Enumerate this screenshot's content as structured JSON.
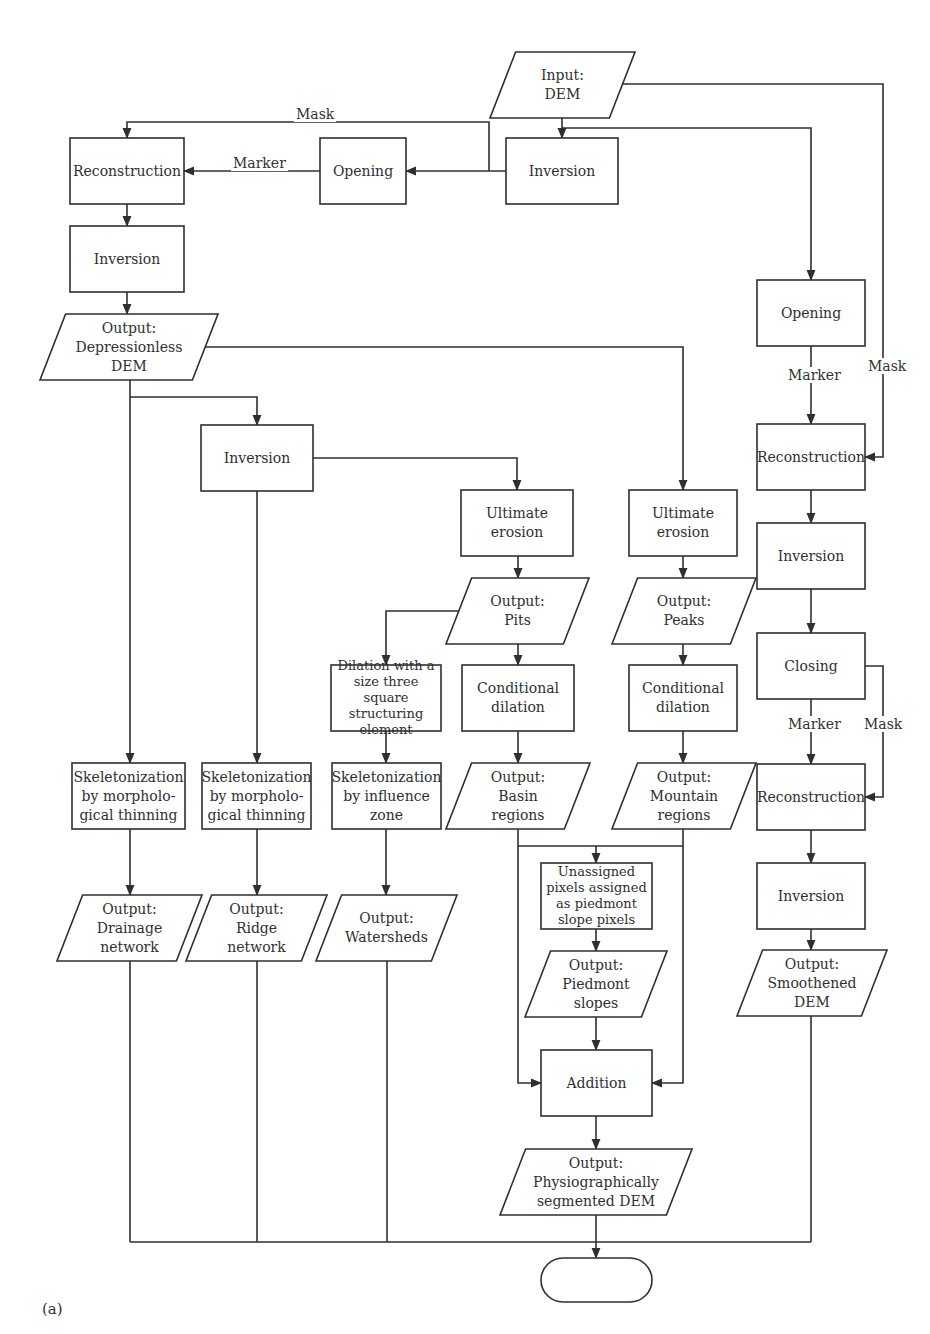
{
  "figure_label": "(a)",
  "nodes": [
    {
      "id": "input_dem",
      "shape": "parallelogram",
      "x": 490,
      "y": 52,
      "w": 145,
      "h": 66,
      "label": "Input:\nDEM"
    },
    {
      "id": "inversion_top",
      "shape": "rect",
      "x": 506,
      "y": 138,
      "w": 112,
      "h": 66,
      "label": "Inversion"
    },
    {
      "id": "opening_top",
      "shape": "rect",
      "x": 320,
      "y": 138,
      "w": 86,
      "h": 66,
      "label": "Opening"
    },
    {
      "id": "reconstruction_left",
      "shape": "rect",
      "x": 70,
      "y": 138,
      "w": 114,
      "h": 66,
      "label": "Reconstruction"
    },
    {
      "id": "inversion_left",
      "shape": "rect",
      "x": 70,
      "y": 226,
      "w": 114,
      "h": 66,
      "label": "Inversion"
    },
    {
      "id": "output_depressionless",
      "shape": "parallelogram",
      "x": 40,
      "y": 314,
      "w": 178,
      "h": 66,
      "label": "Output:\nDepressionless\nDEM"
    },
    {
      "id": "inversion_mid",
      "shape": "rect",
      "x": 201,
      "y": 425,
      "w": 112,
      "h": 66,
      "label": "Inversion"
    },
    {
      "id": "ultimate_erosion_pits",
      "shape": "rect",
      "x": 461,
      "y": 490,
      "w": 112,
      "h": 66,
      "label": "Ultimate\nerosion"
    },
    {
      "id": "ultimate_erosion_peaks",
      "shape": "rect",
      "x": 629,
      "y": 490,
      "w": 108,
      "h": 66,
      "label": "Ultimate\nerosion"
    },
    {
      "id": "opening_right",
      "shape": "rect",
      "x": 757,
      "y": 280,
      "w": 108,
      "h": 66,
      "label": "Opening"
    },
    {
      "id": "reconstruction_right1",
      "shape": "rect",
      "x": 757,
      "y": 424,
      "w": 108,
      "h": 66,
      "label": "Reconstruction"
    },
    {
      "id": "inversion_right1",
      "shape": "rect",
      "x": 757,
      "y": 523,
      "w": 108,
      "h": 66,
      "label": "Inversion"
    },
    {
      "id": "closing",
      "shape": "rect",
      "x": 757,
      "y": 633,
      "w": 108,
      "h": 66,
      "label": "Closing"
    },
    {
      "id": "reconstruction_right2",
      "shape": "rect",
      "x": 757,
      "y": 764,
      "w": 108,
      "h": 66,
      "label": "Reconstruction"
    },
    {
      "id": "inversion_right2",
      "shape": "rect",
      "x": 757,
      "y": 863,
      "w": 108,
      "h": 66,
      "label": "Inversion"
    },
    {
      "id": "output_smoothened",
      "shape": "parallelogram",
      "x": 737,
      "y": 950,
      "w": 150,
      "h": 66,
      "label": "Output:\nSmoothened\nDEM"
    },
    {
      "id": "output_pits",
      "shape": "parallelogram",
      "x": 446,
      "y": 578,
      "w": 143,
      "h": 66,
      "label": "Output:\nPits"
    },
    {
      "id": "output_peaks",
      "shape": "parallelogram",
      "x": 612,
      "y": 578,
      "w": 144,
      "h": 66,
      "label": "Output:\nPeaks"
    },
    {
      "id": "dilation_square",
      "shape": "rect",
      "x": 331,
      "y": 665,
      "w": 110,
      "h": 66,
      "label": "Dilation with a\nsize three square\nstructuring\nelement",
      "small": true
    },
    {
      "id": "conditional_dilation_basin",
      "shape": "rect",
      "x": 462,
      "y": 665,
      "w": 112,
      "h": 66,
      "label": "Conditional\ndilation"
    },
    {
      "id": "conditional_dilation_mountain",
      "shape": "rect",
      "x": 629,
      "y": 665,
      "w": 108,
      "h": 66,
      "label": "Conditional\ndilation"
    },
    {
      "id": "skeleton_drainage",
      "shape": "rect",
      "x": 72,
      "y": 763,
      "w": 113,
      "h": 66,
      "label": "Skeletonization\nby morpholo-\ngical thinning"
    },
    {
      "id": "skeleton_ridge",
      "shape": "rect",
      "x": 202,
      "y": 763,
      "w": 109,
      "h": 66,
      "label": "Skeletonization\nby morpholo-\ngical thinning"
    },
    {
      "id": "skeleton_influence",
      "shape": "rect",
      "x": 332,
      "y": 763,
      "w": 109,
      "h": 66,
      "label": "Skeletonization\nby influence\nzone"
    },
    {
      "id": "output_basin",
      "shape": "parallelogram",
      "x": 446,
      "y": 763,
      "w": 144,
      "h": 66,
      "label": "Output:\nBasin\nregions"
    },
    {
      "id": "output_mountain",
      "shape": "parallelogram",
      "x": 612,
      "y": 763,
      "w": 144,
      "h": 66,
      "label": "Output:\nMountain\nregions"
    },
    {
      "id": "output_drainage",
      "shape": "parallelogram",
      "x": 57,
      "y": 895,
      "w": 145,
      "h": 66,
      "label": "Output:\nDrainage\nnetwork"
    },
    {
      "id": "output_ridge",
      "shape": "parallelogram",
      "x": 186,
      "y": 895,
      "w": 141,
      "h": 66,
      "label": "Output:\nRidge\nnetwork"
    },
    {
      "id": "output_watersheds",
      "shape": "parallelogram",
      "x": 316,
      "y": 895,
      "w": 141,
      "h": 66,
      "label": "Output:\nWatersheds"
    },
    {
      "id": "unassigned_pixels",
      "shape": "rect",
      "x": 541,
      "y": 863,
      "w": 111,
      "h": 66,
      "label": "Unassigned\npixels assigned\nas piedmont\nslope pixels",
      "small": true
    },
    {
      "id": "output_piedmont",
      "shape": "parallelogram",
      "x": 525,
      "y": 951,
      "w": 142,
      "h": 66,
      "label": "Output:\nPiedmont\nslopes"
    },
    {
      "id": "addition",
      "shape": "rect",
      "x": 541,
      "y": 1050,
      "w": 111,
      "h": 66,
      "label": "Addition"
    },
    {
      "id": "output_segmented",
      "shape": "parallelogram",
      "x": 500,
      "y": 1149,
      "w": 192,
      "h": 66,
      "label": "Output:\nPhysiographically\nsegmented DEM"
    },
    {
      "id": "terminator",
      "shape": "terminal",
      "x": 541,
      "y": 1258,
      "w": 111,
      "h": 44,
      "label": ""
    }
  ],
  "edge_labels": [
    {
      "id": "mask_top",
      "text": "Mask",
      "x": 294,
      "y": 114
    },
    {
      "id": "marker_top",
      "text": "Marker",
      "x": 231,
      "y": 163
    },
    {
      "id": "marker_right1",
      "text": "Marker",
      "x": 786,
      "y": 375
    },
    {
      "id": "mask_right1",
      "text": "Mask",
      "x": 866,
      "y": 366
    },
    {
      "id": "marker_right2",
      "text": "Marker",
      "x": 786,
      "y": 724
    },
    {
      "id": "mask_right2",
      "text": "Mask",
      "x": 862,
      "y": 724
    }
  ],
  "edges": [
    {
      "from": "input_dem",
      "to": "inversion_top",
      "points": [
        [
          562,
          118
        ],
        [
          562,
          138
        ]
      ],
      "arrow": true
    },
    {
      "from": "input_dem",
      "to": "opening_right",
      "points": [
        [
          562,
          128
        ],
        [
          811,
          128
        ],
        [
          811,
          280
        ]
      ],
      "arrow": true
    },
    {
      "from": "input_dem",
      "to": "reconstruction_right1",
      "label": "Mask",
      "points": [
        [
          619,
          84
        ],
        [
          883,
          84
        ],
        [
          883,
          457
        ],
        [
          865,
          457
        ]
      ],
      "arrow": true
    },
    {
      "from": "inversion_top",
      "to": "opening_top",
      "points": [
        [
          506,
          171
        ],
        [
          406,
          171
        ]
      ],
      "arrow": true
    },
    {
      "from": "inversion_top",
      "to": "reconstruction_left",
      "label": "Mask",
      "points": [
        [
          489,
          171
        ],
        [
          489,
          122
        ],
        [
          127,
          122
        ],
        [
          127,
          138
        ]
      ],
      "arrow": true
    },
    {
      "from": "opening_top",
      "to": "reconstruction_left",
      "label": "Marker",
      "points": [
        [
          320,
          171
        ],
        [
          184,
          171
        ]
      ],
      "arrow": true
    },
    {
      "from": "reconstruction_left",
      "to": "inversion_left",
      "points": [
        [
          127,
          204
        ],
        [
          127,
          226
        ]
      ],
      "arrow": true
    },
    {
      "from": "inversion_left",
      "to": "output_depressionless",
      "points": [
        [
          127,
          292
        ],
        [
          127,
          314
        ]
      ],
      "arrow": true
    },
    {
      "from": "output_depressionless",
      "to": "ultimate_erosion_peaks",
      "points": [
        [
          205,
          347
        ],
        [
          683,
          347
        ],
        [
          683,
          490
        ]
      ],
      "arrow": true
    },
    {
      "from": "output_depressionless",
      "to": "inversion_mid",
      "points": [
        [
          130,
          397
        ],
        [
          257,
          397
        ],
        [
          257,
          425
        ]
      ],
      "arrow": true
    },
    {
      "from": "output_depressionless",
      "to": "skeleton_drainage",
      "points": [
        [
          130,
          380
        ],
        [
          130,
          763
        ]
      ],
      "arrow": true
    },
    {
      "from": "inversion_mid",
      "to": "ultimate_erosion_pits",
      "points": [
        [
          313,
          458
        ],
        [
          517,
          458
        ],
        [
          517,
          490
        ]
      ],
      "arrow": true
    },
    {
      "from": "inversion_mid",
      "to": "skeleton_ridge",
      "points": [
        [
          257,
          491
        ],
        [
          257,
          763
        ]
      ],
      "arrow": true
    },
    {
      "from": "opening_right",
      "to": "reconstruction_right1",
      "label": "Marker",
      "points": [
        [
          811,
          346
        ],
        [
          811,
          424
        ]
      ],
      "arrow": true
    },
    {
      "from": "reconstruction_right1",
      "to": "inversion_right1",
      "points": [
        [
          811,
          490
        ],
        [
          811,
          523
        ]
      ],
      "arrow": true
    },
    {
      "from": "inversion_right1",
      "to": "closing",
      "points": [
        [
          811,
          589
        ],
        [
          811,
          633
        ]
      ],
      "arrow": true
    },
    {
      "from": "closing",
      "to": "reconstruction_right2",
      "label": "Marker",
      "points": [
        [
          811,
          699
        ],
        [
          811,
          764
        ]
      ],
      "arrow": true
    },
    {
      "from": "closing",
      "to": "reconstruction_right2",
      "label": "Mask",
      "points": [
        [
          865,
          666
        ],
        [
          883,
          666
        ],
        [
          883,
          797
        ],
        [
          865,
          797
        ]
      ],
      "arrow": true
    },
    {
      "from": "reconstruction_right2",
      "to": "inversion_right2",
      "points": [
        [
          811,
          830
        ],
        [
          811,
          863
        ]
      ],
      "arrow": true
    },
    {
      "from": "inversion_right2",
      "to": "output_smoothened",
      "points": [
        [
          811,
          929
        ],
        [
          811,
          950
        ]
      ],
      "arrow": true
    },
    {
      "from": "ultimate_erosion_pits",
      "to": "output_pits",
      "points": [
        [
          518,
          556
        ],
        [
          518,
          578
        ]
      ],
      "arrow": true
    },
    {
      "from": "ultimate_erosion_peaks",
      "to": "output_peaks",
      "points": [
        [
          683,
          556
        ],
        [
          683,
          578
        ]
      ],
      "arrow": true
    },
    {
      "from": "output_pits",
      "to": "dilation_square",
      "points": [
        [
          462,
          611
        ],
        [
          386,
          611
        ],
        [
          386,
          665
        ]
      ],
      "arrow": true
    },
    {
      "from": "output_pits",
      "to": "conditional_dilation_basin",
      "points": [
        [
          518,
          644
        ],
        [
          518,
          665
        ]
      ],
      "arrow": true
    },
    {
      "from": "output_peaks",
      "to": "conditional_dilation_mountain",
      "points": [
        [
          683,
          644
        ],
        [
          683,
          665
        ]
      ],
      "arrow": true
    },
    {
      "from": "dilation_square",
      "to": "skeleton_influence",
      "points": [
        [
          386,
          731
        ],
        [
          386,
          763
        ]
      ],
      "arrow": true
    },
    {
      "from": "conditional_dilation_basin",
      "to": "output_basin",
      "points": [
        [
          518,
          731
        ],
        [
          518,
          763
        ]
      ],
      "arrow": true
    },
    {
      "from": "conditional_dilation_mountain",
      "to": "output_mountain",
      "points": [
        [
          683,
          731
        ],
        [
          683,
          763
        ]
      ],
      "arrow": true
    },
    {
      "from": "skeleton_drainage",
      "to": "output_drainage",
      "points": [
        [
          130,
          829
        ],
        [
          130,
          895
        ]
      ],
      "arrow": true
    },
    {
      "from": "skeleton_ridge",
      "to": "output_ridge",
      "points": [
        [
          257,
          829
        ],
        [
          257,
          895
        ]
      ],
      "arrow": true
    },
    {
      "from": "skeleton_influence",
      "to": "output_watersheds",
      "points": [
        [
          386,
          829
        ],
        [
          386,
          895
        ]
      ],
      "arrow": true
    },
    {
      "from": "output_basin",
      "to": "addition",
      "points": [
        [
          518,
          829
        ],
        [
          518,
          1083
        ],
        [
          541,
          1083
        ]
      ],
      "arrow": true
    },
    {
      "from": "output_mountain",
      "to": "addition",
      "points": [
        [
          683,
          829
        ],
        [
          683,
          1083
        ],
        [
          652,
          1083
        ]
      ],
      "arrow": true
    },
    {
      "from": "output_basin",
      "to": "unassigned_pixels",
      "points": [
        [
          518,
          846
        ],
        [
          683,
          846
        ]
      ],
      "arrow": false
    },
    {
      "from": "junction",
      "to": "unassigned_pixels",
      "points": [
        [
          596,
          846
        ],
        [
          596,
          863
        ]
      ],
      "arrow": true
    },
    {
      "from": "unassigned_pixels",
      "to": "output_piedmont",
      "points": [
        [
          596,
          929
        ],
        [
          596,
          951
        ]
      ],
      "arrow": true
    },
    {
      "from": "output_piedmont",
      "to": "addition",
      "points": [
        [
          596,
          1017
        ],
        [
          596,
          1050
        ]
      ],
      "arrow": true
    },
    {
      "from": "addition",
      "to": "output_segmented",
      "points": [
        [
          596,
          1116
        ],
        [
          596,
          1149
        ]
      ],
      "arrow": true
    },
    {
      "from": "output_drainage",
      "to": "bus",
      "points": [
        [
          130,
          961
        ],
        [
          130,
          1242
        ]
      ],
      "arrow": false
    },
    {
      "from": "output_ridge",
      "to": "bus",
      "points": [
        [
          257,
          961
        ],
        [
          257,
          1242
        ]
      ],
      "arrow": false
    },
    {
      "from": "output_watersheds",
      "to": "bus",
      "points": [
        [
          387,
          961
        ],
        [
          387,
          1242
        ]
      ],
      "arrow": false
    },
    {
      "from": "output_smoothened",
      "to": "bus",
      "points": [
        [
          811,
          1016
        ],
        [
          811,
          1242
        ]
      ],
      "arrow": false
    },
    {
      "from": "bus",
      "to": "bus",
      "points": [
        [
          130,
          1242
        ],
        [
          811,
          1242
        ]
      ],
      "arrow": false
    },
    {
      "from": "output_segmented",
      "to": "terminator",
      "points": [
        [
          596,
          1215
        ],
        [
          596,
          1258
        ]
      ],
      "arrow": true
    }
  ]
}
